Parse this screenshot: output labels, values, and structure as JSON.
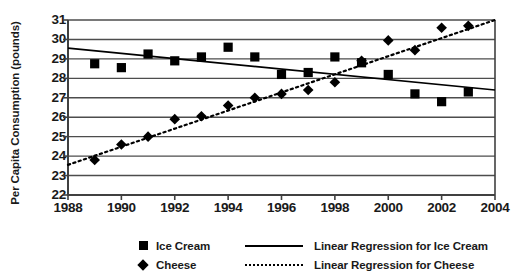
{
  "chart_data": {
    "type": "scatter",
    "title": "",
    "xlabel": "",
    "ylabel": "Per Capita Consumption (pounds)",
    "xlim": [
      1988,
      2004
    ],
    "ylim": [
      22,
      31
    ],
    "xticks": [
      1988,
      1990,
      1992,
      1994,
      1996,
      1998,
      2000,
      2002,
      2004
    ],
    "yticks": [
      22,
      23,
      24,
      25,
      26,
      27,
      28,
      29,
      30,
      31
    ],
    "grid": "horizontal",
    "legend_position": "bottom",
    "x": [
      1989,
      1990,
      1991,
      1992,
      1993,
      1994,
      1995,
      1996,
      1997,
      1998,
      1999,
      2000,
      2001,
      2002,
      2003
    ],
    "series": [
      {
        "name": "Ice Cream",
        "marker": "square",
        "values": [
          28.75,
          28.55,
          29.25,
          28.9,
          29.1,
          29.6,
          29.1,
          28.2,
          28.3,
          29.1,
          28.8,
          28.2,
          27.2,
          26.8,
          27.3
        ]
      },
      {
        "name": "Cheese",
        "marker": "diamond",
        "values": [
          23.8,
          24.6,
          25.0,
          25.9,
          26.05,
          26.6,
          27.0,
          27.2,
          27.4,
          27.8,
          28.9,
          29.95,
          29.45,
          30.6,
          30.7
        ]
      }
    ],
    "trendlines": [
      {
        "name": "Linear Regression for Ice Cream",
        "style": "solid",
        "x_start": 1988,
        "y_start": 29.55,
        "x_end": 2004,
        "y_end": 27.4
      },
      {
        "name": "Linear Regression for Cheese",
        "style": "dotted",
        "x_start": 1988,
        "y_start": 23.55,
        "x_end": 2004,
        "y_end": 31.0
      }
    ]
  },
  "legend": {
    "items": [
      {
        "marker": "square",
        "name": "Ice Cream",
        "line": "solid",
        "line_label": "Linear Regression for Ice Cream"
      },
      {
        "marker": "diamond",
        "name": "Cheese",
        "line": "dotted",
        "line_label": "Linear Regression for Cheese"
      }
    ]
  },
  "colors": {
    "marker": "#000000",
    "axis": "#404040",
    "grid": "#4d4d4d",
    "background": "#ffffff"
  }
}
